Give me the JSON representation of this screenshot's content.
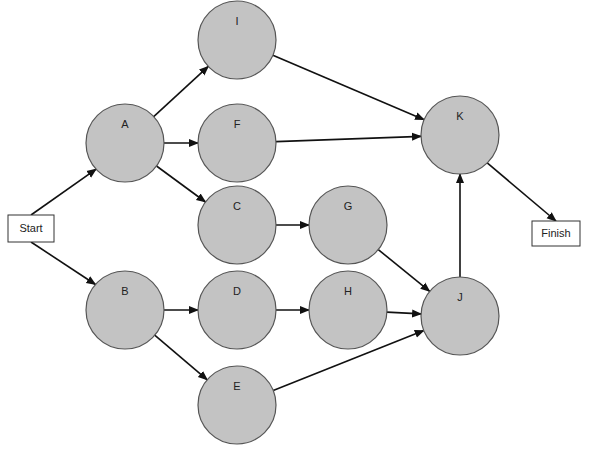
{
  "diagram": {
    "type": "activity-network",
    "colors": {
      "node_fill": "#c3c3c3",
      "node_stroke": "#555555",
      "edge": "#111111",
      "box_fill": "#ffffff"
    },
    "terminals": {
      "start": {
        "label": "Start",
        "x": 8,
        "y": 215,
        "w": 46,
        "h": 27
      },
      "finish": {
        "label": "Finish",
        "x": 532,
        "y": 221,
        "w": 48,
        "h": 25
      }
    },
    "nodes": [
      {
        "id": "A",
        "label": "A",
        "cx": 125,
        "cy": 143
      },
      {
        "id": "B",
        "label": "B",
        "cx": 125,
        "cy": 310
      },
      {
        "id": "I",
        "label": "I",
        "cx": 237,
        "cy": 40
      },
      {
        "id": "F",
        "label": "F",
        "cx": 237,
        "cy": 143
      },
      {
        "id": "C",
        "label": "C",
        "cx": 237,
        "cy": 225
      },
      {
        "id": "G",
        "label": "G",
        "cx": 348,
        "cy": 225
      },
      {
        "id": "D",
        "label": "D",
        "cx": 237,
        "cy": 310
      },
      {
        "id": "H",
        "label": "H",
        "cx": 348,
        "cy": 310
      },
      {
        "id": "E",
        "label": "E",
        "cx": 237,
        "cy": 405
      },
      {
        "id": "J",
        "label": "J",
        "cx": 460,
        "cy": 316
      },
      {
        "id": "K",
        "label": "K",
        "cx": 460,
        "cy": 135
      }
    ],
    "node_radius": 39,
    "edges": [
      {
        "from": "Start",
        "to": "A"
      },
      {
        "from": "Start",
        "to": "B"
      },
      {
        "from": "A",
        "to": "I"
      },
      {
        "from": "A",
        "to": "F"
      },
      {
        "from": "A",
        "to": "C"
      },
      {
        "from": "B",
        "to": "D"
      },
      {
        "from": "B",
        "to": "E"
      },
      {
        "from": "C",
        "to": "G"
      },
      {
        "from": "D",
        "to": "H"
      },
      {
        "from": "G",
        "to": "J"
      },
      {
        "from": "H",
        "to": "J"
      },
      {
        "from": "E",
        "to": "J"
      },
      {
        "from": "I",
        "to": "K"
      },
      {
        "from": "F",
        "to": "K"
      },
      {
        "from": "J",
        "to": "K"
      },
      {
        "from": "K",
        "to": "Finish"
      }
    ]
  }
}
